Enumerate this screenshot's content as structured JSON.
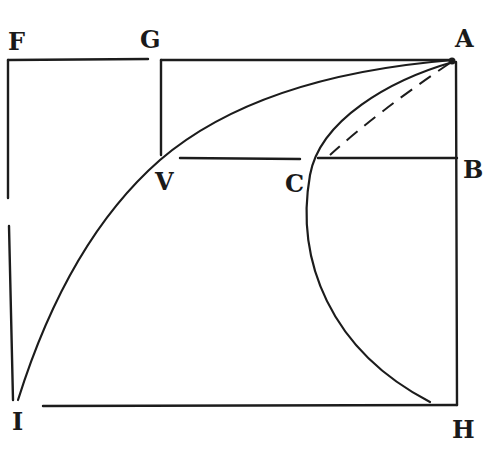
{
  "figure": {
    "ink_color": "#1c1c1c",
    "background": "#ffffff"
  },
  "labels": {
    "F": "F",
    "G": "G",
    "A": "A",
    "B": "B",
    "V": "V",
    "C": "C",
    "I": "I",
    "H": "H"
  },
  "points": {
    "F": [
      8,
      60
    ],
    "G": [
      160,
      60
    ],
    "A": [
      453,
      60
    ],
    "B": [
      457,
      158
    ],
    "V": [
      155,
      158
    ],
    "C": [
      310,
      160
    ],
    "I": [
      15,
      402
    ],
    "H": [
      457,
      405
    ]
  }
}
